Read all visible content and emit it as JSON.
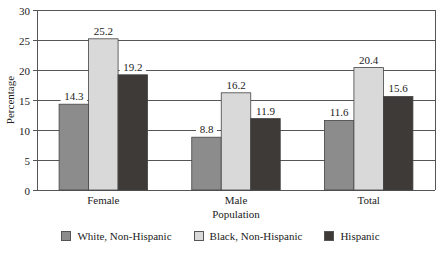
{
  "chart_data": {
    "type": "bar",
    "title": "",
    "xlabel": "Population",
    "ylabel": "Percentage",
    "ylim": [
      0,
      30
    ],
    "yticks": [
      0,
      5,
      10,
      15,
      20,
      25,
      30
    ],
    "grid": true,
    "legend_position": "bottom",
    "categories": [
      "Female",
      "Male",
      "Total"
    ],
    "series": [
      {
        "name": "White, Non-Hispanic",
        "color": "#8c8c8c",
        "values": [
          14.3,
          8.8,
          11.6
        ]
      },
      {
        "name": "Black, Non-Hispanic",
        "color": "#d9d9d9",
        "values": [
          25.2,
          16.2,
          20.4
        ]
      },
      {
        "name": "Hispanic",
        "color": "#3d3a38",
        "values": [
          19.2,
          11.9,
          15.6
        ]
      }
    ]
  }
}
